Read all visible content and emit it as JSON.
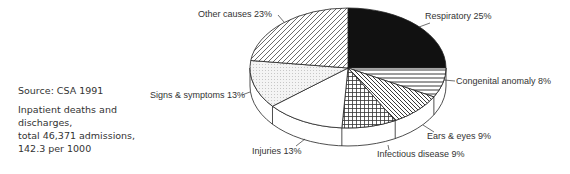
{
  "notes": {
    "source": "Source: CSA 1991",
    "description_lines": [
      "Inpatient deaths and",
      "discharges,",
      "total 46,371 admissions,",
      "142.3 per 1000"
    ]
  },
  "chart_data": {
    "type": "pie",
    "style": "3d-extruded",
    "title": "",
    "source": "Source: CSA 1991",
    "description": "Inpatient deaths and discharges, total 46,371 admissions, 142.3 per 1000",
    "start_angle_deg": 0,
    "direction": "clockwise",
    "slices": [
      {
        "label": "Respiratory",
        "value": 25,
        "display": "Respiratory  25%",
        "pattern": "solid-black"
      },
      {
        "label": "Congenital anomaly",
        "value": 8,
        "display": "Congenital anomaly  8%",
        "pattern": "horizontal-lines"
      },
      {
        "label": "Ears & eyes",
        "value": 9,
        "display": "Ears & eyes  9%",
        "pattern": "diagonal-back"
      },
      {
        "label": "Infectious disease",
        "value": 9,
        "display": "Infectious disease  9%",
        "pattern": "crosshatch-grid"
      },
      {
        "label": "Injuries",
        "value": 13,
        "display": "Injuries  13%",
        "pattern": "white"
      },
      {
        "label": "Signs & symptoms",
        "value": 13,
        "display": "Signs & symptoms  13%",
        "pattern": "dots"
      },
      {
        "label": "Other causes",
        "value": 23,
        "display": "Other causes  23%",
        "pattern": "diagonal-forward"
      }
    ],
    "legend": "none (callout labels)",
    "unit": "%"
  }
}
